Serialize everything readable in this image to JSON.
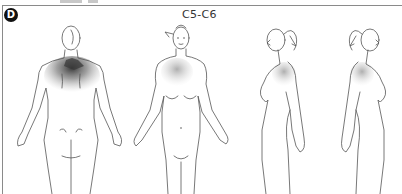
{
  "panel": {
    "label": "D",
    "title": "C5-C6"
  },
  "figures": [
    {
      "view": "posterior",
      "shading": "dark neck and upper back between shoulder blades"
    },
    {
      "view": "anterior",
      "shading": "light right shoulder / upper chest"
    },
    {
      "view": "lateral-left",
      "shading": "light posterior neck and shoulder"
    },
    {
      "view": "lateral-right",
      "shading": "light posterior neck and shoulder"
    }
  ],
  "colors": {
    "line": "#555555",
    "shading_dark": "#3a3a3a",
    "shading_light": "#bdbdbd",
    "badge": "#111111"
  }
}
